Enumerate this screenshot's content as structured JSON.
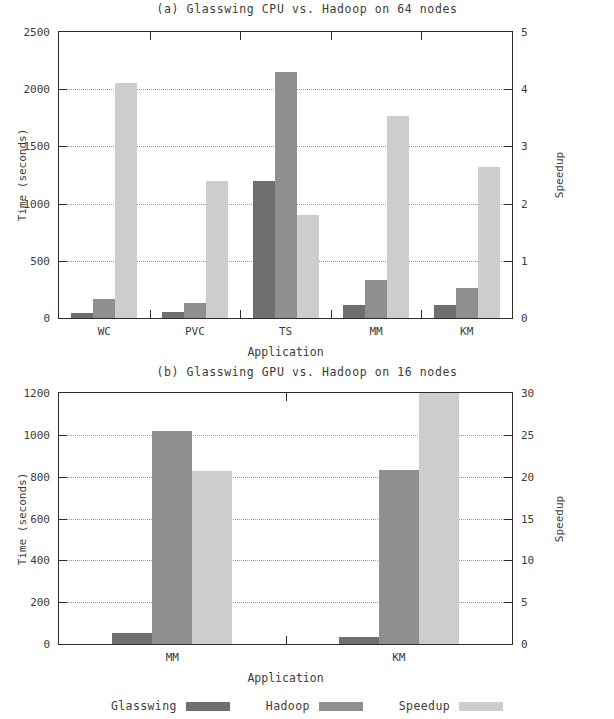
{
  "figure": {
    "legend": [
      {
        "label": "Glasswing",
        "key": "glasswing",
        "color": "#6f6f6f"
      },
      {
        "label": "Hadoop",
        "key": "hadoop",
        "color": "#8f8f8f"
      },
      {
        "label": "Speedup",
        "key": "speedup",
        "color": "#cdcdcd"
      }
    ]
  },
  "chart_data": [
    {
      "type": "bar",
      "panel": "a",
      "title": "(a) Glasswing CPU vs. Hadoop on 64 nodes",
      "xlabel": "Application",
      "ylabel": "Time (seconds)",
      "y2label": "Speedup",
      "categories": [
        "WC",
        "PVC",
        "TS",
        "MM",
        "KM"
      ],
      "ylim": [
        0,
        2500
      ],
      "yticks": [
        0,
        500,
        1000,
        1500,
        2000,
        2500
      ],
      "y2lim": [
        0,
        5
      ],
      "y2ticks": [
        0,
        1,
        2,
        3,
        4,
        5
      ],
      "grid": true,
      "legend_position": "bottom",
      "series": [
        {
          "name": "Glasswing",
          "axis": "left",
          "values": [
            40,
            55,
            1200,
            110,
            115
          ]
        },
        {
          "name": "Hadoop",
          "axis": "left",
          "values": [
            165,
            130,
            2150,
            330,
            260
          ]
        },
        {
          "name": "Speedup",
          "axis": "right",
          "values": [
            4.1,
            2.4,
            1.8,
            3.53,
            2.64
          ]
        }
      ]
    },
    {
      "type": "bar",
      "panel": "b",
      "title": "(b) Glasswing GPU vs. Hadoop on 16 nodes",
      "xlabel": "Application",
      "ylabel": "Time (seconds)",
      "y2label": "Speedup",
      "categories": [
        "MM",
        "KM"
      ],
      "ylim": [
        0,
        1200
      ],
      "yticks": [
        0,
        200,
        400,
        600,
        800,
        1000,
        1200
      ],
      "y2lim": [
        0,
        30
      ],
      "y2ticks": [
        0,
        5,
        10,
        15,
        20,
        25,
        30
      ],
      "grid": true,
      "legend_position": "bottom",
      "series": [
        {
          "name": "Glasswing",
          "axis": "left",
          "values": [
            55,
            35
          ]
        },
        {
          "name": "Hadoop",
          "axis": "left",
          "values": [
            1020,
            830
          ]
        },
        {
          "name": "Speedup",
          "axis": "right",
          "values": [
            20.7,
            30
          ]
        }
      ]
    }
  ]
}
